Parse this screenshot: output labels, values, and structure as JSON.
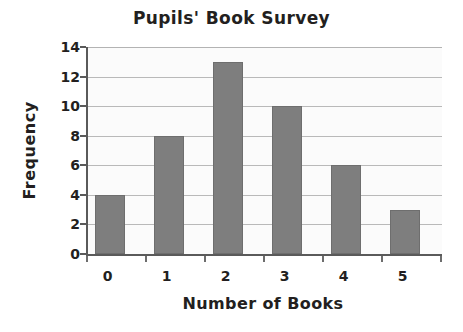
{
  "chart_data": {
    "type": "bar",
    "title": "Pupils' Book Survey",
    "xlabel": "Number of Books",
    "ylabel": "Frequency",
    "categories": [
      "0",
      "1",
      "2",
      "3",
      "4",
      "5"
    ],
    "values": [
      4,
      8,
      13,
      10,
      6,
      3
    ],
    "ylim": [
      0,
      14
    ],
    "ytick_step": 2,
    "yticks": [
      0,
      2,
      4,
      6,
      8,
      10,
      12,
      14
    ],
    "ytick_labels": [
      "0",
      "2",
      "4",
      "6",
      "8",
      "10",
      "12",
      "14"
    ],
    "grid": true,
    "grid_axis": "y",
    "legend": false,
    "bar_color": "#7e7e7e",
    "plot_background": "#fbfbfb",
    "axis_color": "#5a5a5a",
    "gridline_color": "#b9b9b9",
    "text_color": "#231f20"
  }
}
